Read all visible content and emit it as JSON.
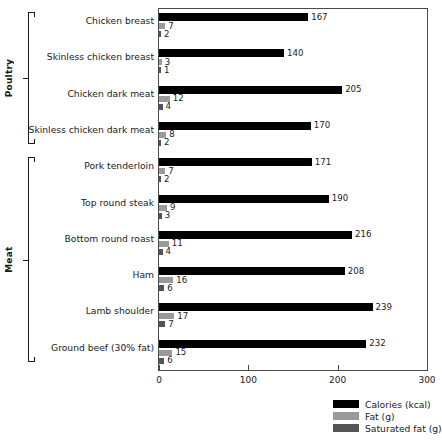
{
  "chart_data": {
    "type": "bar",
    "orientation": "horizontal",
    "title": "",
    "xlabel": "",
    "ylabel": "",
    "xlim": [
      0,
      300
    ],
    "xticks": [
      0,
      100,
      200,
      300
    ],
    "xtick_labels": [
      "0",
      "100",
      "200",
      "300"
    ],
    "grid": false,
    "legend_position": "bottom-right",
    "categories": [
      "Chicken breast",
      "Skinless chicken breast",
      "Chicken dark meat",
      "Skinless chicken dark meat",
      "Pork tenderloin",
      "Top round steak",
      "Bottom round roast",
      "Ham",
      "Lamb shoulder",
      "Ground beef (30% fat)"
    ],
    "series": [
      {
        "name": "Calories (kcal)",
        "color": "#000000",
        "values": [
          167,
          140,
          205,
          170,
          171,
          190,
          216,
          208,
          239,
          232
        ]
      },
      {
        "name": "Fat (g)",
        "color": "#9a9a9a",
        "values": [
          7,
          3,
          12,
          8,
          7,
          9,
          11,
          16,
          17,
          15
        ]
      },
      {
        "name": "Saturated fat (g)",
        "color": "#545454",
        "values": [
          2,
          1,
          4,
          2,
          2,
          3,
          4,
          6,
          7,
          6
        ]
      }
    ],
    "groups": [
      {
        "label": "Poultry",
        "first_index": 0,
        "last_index": 3
      },
      {
        "label": "Meat",
        "first_index": 4,
        "last_index": 9
      }
    ]
  },
  "legend": {
    "items": [
      {
        "label": "Calories (kcal)",
        "key": "calories"
      },
      {
        "label": "Fat (g)",
        "key": "fat"
      },
      {
        "label": "Saturated fat (g)",
        "key": "satfat"
      }
    ]
  }
}
